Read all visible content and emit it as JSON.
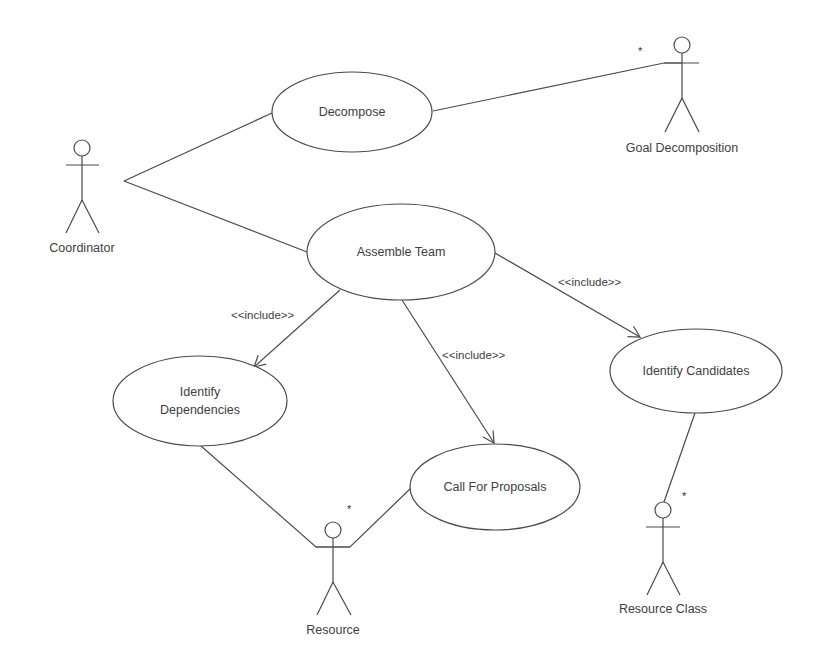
{
  "diagram": {
    "type": "UML use case diagram",
    "colors": {
      "line": "#4a4a4a",
      "text": "#404040",
      "background": "#ffffff"
    },
    "actors": [
      {
        "id": "coordinator",
        "label": "Coordinator"
      },
      {
        "id": "goal_decomposition",
        "label": "Goal Decomposition",
        "multiplicity": "*"
      },
      {
        "id": "resource",
        "label": "Resource",
        "multiplicity": "*"
      },
      {
        "id": "resource_class",
        "label": "Resource Class",
        "multiplicity": "*"
      }
    ],
    "use_cases": [
      {
        "id": "decompose",
        "label": "Decompose"
      },
      {
        "id": "assemble_team",
        "label": "Assemble Team"
      },
      {
        "id": "identify_dependencies",
        "label_line1": "Identify",
        "label_line2": "Dependencies"
      },
      {
        "id": "call_for_proposals",
        "label": "Call For Proposals"
      },
      {
        "id": "identify_candidates",
        "label": "Identify Candidates"
      }
    ],
    "relationships": [
      {
        "type": "association",
        "from": "Coordinator",
        "to": "Decompose"
      },
      {
        "type": "association",
        "from": "Coordinator",
        "to": "Assemble Team"
      },
      {
        "type": "association",
        "from": "Decompose",
        "to": "Goal Decomposition"
      },
      {
        "type": "include",
        "from": "Assemble Team",
        "to": "Identify Dependencies",
        "label": "<<include>>"
      },
      {
        "type": "include",
        "from": "Assemble Team",
        "to": "Call For Proposals",
        "label": "<<include>>"
      },
      {
        "type": "include",
        "from": "Assemble Team",
        "to": "Identify Candidates",
        "label": "<<include>>"
      },
      {
        "type": "association",
        "from": "Identify Dependencies",
        "to": "Resource"
      },
      {
        "type": "association",
        "from": "Call For Proposals",
        "to": "Resource"
      },
      {
        "type": "association",
        "from": "Identify Candidates",
        "to": "Resource Class"
      }
    ]
  }
}
